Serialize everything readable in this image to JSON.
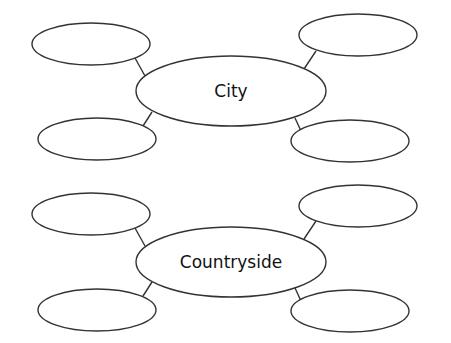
{
  "diagrams": [
    {
      "center_label": "City",
      "branches": [
        "",
        "",
        "",
        ""
      ]
    },
    {
      "center_label": "Countryside",
      "branches": [
        "",
        "",
        "",
        ""
      ]
    }
  ],
  "colors": {
    "stroke": "#333333",
    "text": "#111111",
    "background": "#ffffff"
  }
}
